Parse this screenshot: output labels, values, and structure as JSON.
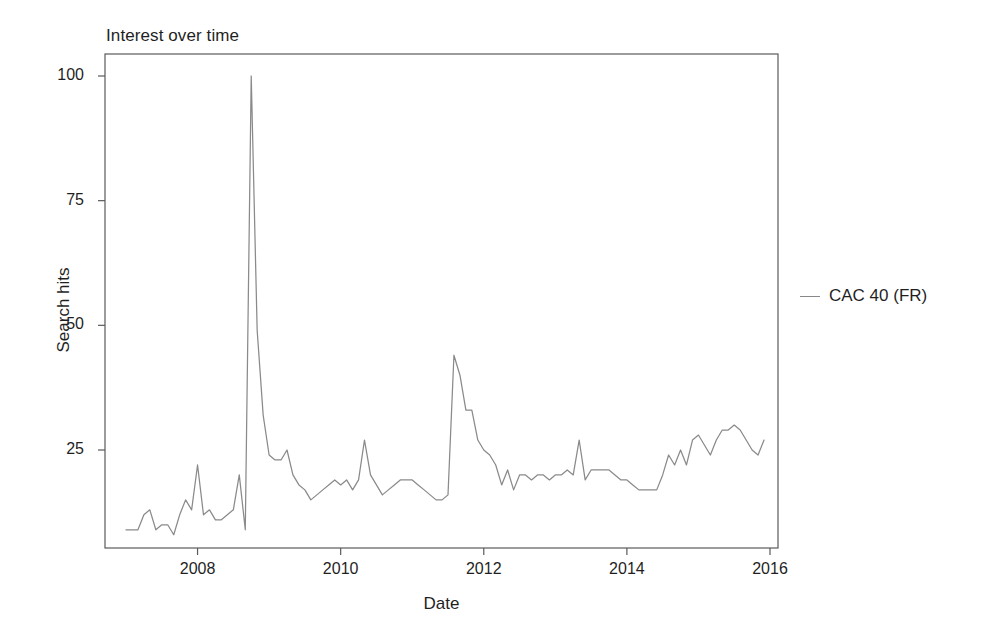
{
  "chart_data": {
    "type": "line",
    "title": "Interest over time",
    "xlabel": "Date",
    "ylabel": "Search hits",
    "grid": false,
    "legend_position": "right",
    "xlim": [
      2007.0,
      2015.92
    ],
    "ylim": [
      0,
      104
    ],
    "xticks": [
      2008,
      2010,
      2012,
      2014,
      2016
    ],
    "xtick_labels": [
      "2008",
      "2010",
      "2012",
      "2014",
      "2016"
    ],
    "yticks": [
      25,
      50,
      75,
      100
    ],
    "ytick_labels": [
      "25",
      "50",
      "75",
      "100"
    ],
    "series": [
      {
        "name": "CAC 40 (FR)",
        "color": "#8a8a8a",
        "x": [
          2007.0,
          2007.083,
          2007.167,
          2007.25,
          2007.333,
          2007.417,
          2007.5,
          2007.583,
          2007.667,
          2007.75,
          2007.833,
          2007.917,
          2008.0,
          2008.083,
          2008.167,
          2008.25,
          2008.333,
          2008.417,
          2008.5,
          2008.583,
          2008.667,
          2008.75,
          2008.833,
          2008.917,
          2009.0,
          2009.083,
          2009.167,
          2009.25,
          2009.333,
          2009.417,
          2009.5,
          2009.583,
          2009.667,
          2009.75,
          2009.833,
          2009.917,
          2010.0,
          2010.083,
          2010.167,
          2010.25,
          2010.333,
          2010.417,
          2010.5,
          2010.583,
          2010.667,
          2010.75,
          2010.833,
          2010.917,
          2011.0,
          2011.083,
          2011.167,
          2011.25,
          2011.333,
          2011.417,
          2011.5,
          2011.583,
          2011.667,
          2011.75,
          2011.833,
          2011.917,
          2012.0,
          2012.083,
          2012.167,
          2012.25,
          2012.333,
          2012.417,
          2012.5,
          2012.583,
          2012.667,
          2012.75,
          2012.833,
          2012.917,
          2013.0,
          2013.083,
          2013.167,
          2013.25,
          2013.333,
          2013.417,
          2013.5,
          2013.583,
          2013.667,
          2013.75,
          2013.833,
          2013.917,
          2014.0,
          2014.083,
          2014.167,
          2014.25,
          2014.333,
          2014.417,
          2014.5,
          2014.583,
          2014.667,
          2014.75,
          2014.833,
          2014.917,
          2015.0,
          2015.083,
          2015.167,
          2015.25,
          2015.333,
          2015.417,
          2015.5,
          2015.583,
          2015.667,
          2015.75,
          2015.833,
          2015.917
        ],
        "values": [
          9,
          9,
          9,
          12,
          13,
          9,
          10,
          10,
          8,
          12,
          15,
          13,
          22,
          12,
          13,
          11,
          11,
          12,
          13,
          20,
          9,
          100,
          49,
          32,
          24,
          23,
          23,
          25,
          20,
          18,
          17,
          15,
          16,
          17,
          18,
          19,
          18,
          19,
          17,
          19,
          27,
          20,
          18,
          16,
          17,
          18,
          19,
          19,
          19,
          18,
          17,
          16,
          15,
          15,
          16,
          44,
          40,
          33,
          33,
          27,
          25,
          24,
          22,
          18,
          21,
          17,
          20,
          20,
          19,
          20,
          20,
          19,
          20,
          20,
          21,
          20,
          27,
          19,
          21,
          21,
          21,
          21,
          20,
          19,
          19,
          18,
          17,
          17,
          17,
          17,
          20,
          24,
          22,
          25,
          22,
          27,
          28,
          26,
          24,
          27,
          29,
          29,
          30,
          29,
          27,
          25,
          24,
          27
        ]
      }
    ]
  },
  "legend": {
    "entries": [
      {
        "label": "CAC 40 (FR)"
      }
    ]
  }
}
